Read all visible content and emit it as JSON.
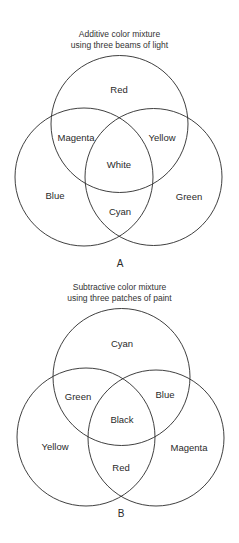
{
  "diagram_a": {
    "title_line1": "Additive color mixture",
    "title_line2": "using three beams of light",
    "panel_label": "A",
    "regions": {
      "top": "Red",
      "left": "Blue",
      "right": "Green",
      "top_left": "Magenta",
      "top_right": "Yellow",
      "bottom_center": "Cyan",
      "center": "White"
    }
  },
  "diagram_b": {
    "title_line1": "Subtractive color mixture",
    "title_line2": "using three patches of paint",
    "panel_label": "B",
    "regions": {
      "top": "Cyan",
      "left": "Yellow",
      "right": "Magenta",
      "top_left": "Green",
      "top_right": "Blue",
      "bottom_center": "Red",
      "center": "Black"
    }
  },
  "style": {
    "stroke_color": "#2a2a2a",
    "background": "#ffffff"
  }
}
